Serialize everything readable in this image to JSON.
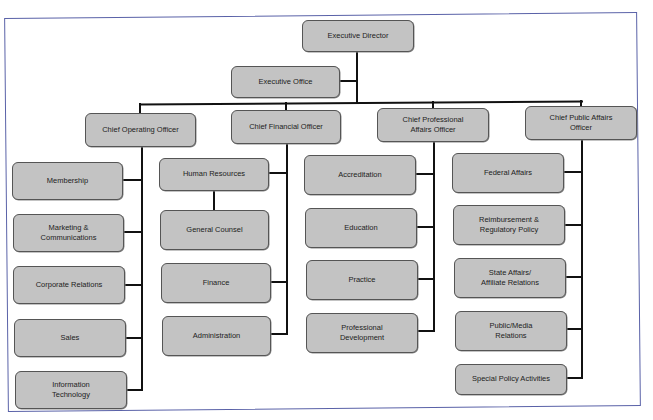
{
  "diagram": {
    "type": "org-chart",
    "frame_color": "#5a62a8",
    "box_fill": "#c3c3c3",
    "box_border": "#555555",
    "root": {
      "label": "Executive Director"
    },
    "staff": {
      "label": "Executive Office"
    },
    "officers": [
      {
        "label": "Chief Operating Officer",
        "children": [
          "Membership",
          "Marketing &\nCommunications",
          "Corporate Relations",
          "Sales",
          "Information\nTechnology"
        ]
      },
      {
        "label": "Chief Financial Officer",
        "children": [
          "Human Resources",
          "General Counsel",
          "Finance",
          "Administration"
        ]
      },
      {
        "label": "Chief Professional\nAffairs Officer",
        "children": [
          "Accreditation",
          "Education",
          "Practice",
          "Professional\nDevelopment"
        ]
      },
      {
        "label": "Chief Public Affairs\nOfficer",
        "children": [
          "Federal Affairs",
          "Reimbursement &\nRegulatory Policy",
          "State Affairs/\nAffiliate Relations",
          "Public/Media\nRelations",
          "Special Policy Activities"
        ]
      }
    ]
  }
}
